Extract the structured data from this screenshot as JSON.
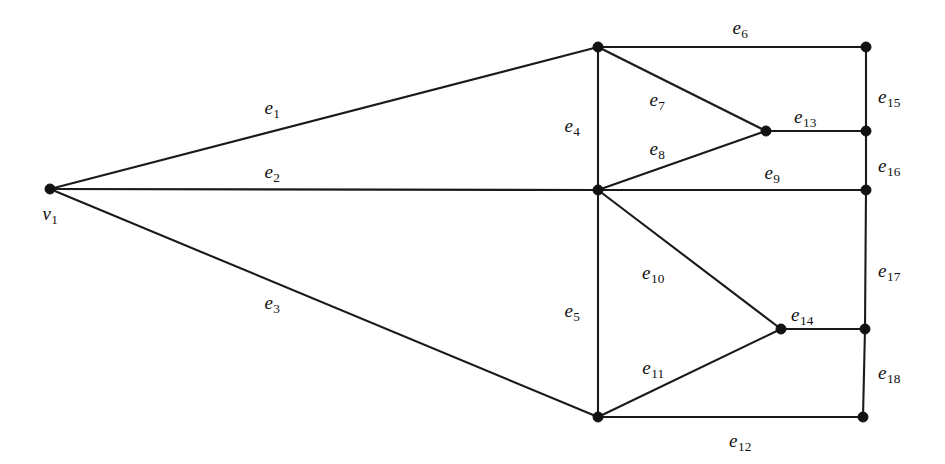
{
  "figure": {
    "width": 945,
    "height": 464,
    "background_color": "#ffffff",
    "ink_color": "#111111"
  },
  "chart_data": {
    "type": "diagram",
    "subtype": "node-link-graph",
    "title": "",
    "background": "#ffffff",
    "stroke_color": "#1a1a1a",
    "vertex_color": "#121212",
    "vertex_radius": 5,
    "nodes": [
      {
        "id": "v1",
        "label": "v",
        "sub": "1",
        "x": 50,
        "y": 189,
        "labeled": true,
        "label_x": 50,
        "label_y": 213
      },
      {
        "id": "a",
        "label": "",
        "sub": "",
        "x": 598,
        "y": 47,
        "labeled": false,
        "label_x": 0,
        "label_y": 0
      },
      {
        "id": "b",
        "label": "",
        "sub": "",
        "x": 598,
        "y": 190,
        "labeled": false,
        "label_x": 0,
        "label_y": 0
      },
      {
        "id": "c",
        "label": "",
        "sub": "",
        "x": 598,
        "y": 417,
        "labeled": false,
        "label_x": 0,
        "label_y": 0
      },
      {
        "id": "d",
        "label": "",
        "sub": "",
        "x": 766,
        "y": 131,
        "labeled": false,
        "label_x": 0,
        "label_y": 0
      },
      {
        "id": "e",
        "label": "",
        "sub": "",
        "x": 781,
        "y": 329,
        "labeled": false,
        "label_x": 0,
        "label_y": 0
      },
      {
        "id": "f",
        "label": "",
        "sub": "",
        "x": 866,
        "y": 47,
        "labeled": false,
        "label_x": 0,
        "label_y": 0
      },
      {
        "id": "g",
        "label": "",
        "sub": "",
        "x": 866,
        "y": 131,
        "labeled": false,
        "label_x": 0,
        "label_y": 0
      },
      {
        "id": "h",
        "label": "",
        "sub": "",
        "x": 866,
        "y": 190,
        "labeled": false,
        "label_x": 0,
        "label_y": 0
      },
      {
        "id": "i",
        "label": "",
        "sub": "",
        "x": 865,
        "y": 329,
        "labeled": false,
        "label_x": 0,
        "label_y": 0
      },
      {
        "id": "j",
        "label": "",
        "sub": "",
        "x": 863,
        "y": 417,
        "labeled": false,
        "label_x": 0,
        "label_y": 0
      }
    ],
    "edges": [
      {
        "id": "e1",
        "label": "e",
        "sub": "1",
        "from": "v1",
        "to": "a",
        "x1": 50,
        "y1": 189,
        "x2": 598,
        "y2": 47,
        "label_x": 272,
        "label_y": 107
      },
      {
        "id": "e2",
        "label": "e",
        "sub": "2",
        "from": "v1",
        "to": "b",
        "x1": 50,
        "y1": 189,
        "x2": 598,
        "y2": 190,
        "label_x": 272,
        "label_y": 171
      },
      {
        "id": "e3",
        "label": "e",
        "sub": "3",
        "from": "v1",
        "to": "c",
        "x1": 50,
        "y1": 189,
        "x2": 598,
        "y2": 417,
        "label_x": 272,
        "label_y": 302
      },
      {
        "id": "e4",
        "label": "e",
        "sub": "4",
        "from": "a",
        "to": "b",
        "x1": 598,
        "y1": 47,
        "x2": 598,
        "y2": 190,
        "label_x": 572,
        "label_y": 125
      },
      {
        "id": "e5",
        "label": "e",
        "sub": "5",
        "from": "b",
        "to": "c",
        "x1": 598,
        "y1": 190,
        "x2": 598,
        "y2": 417,
        "label_x": 572,
        "label_y": 310
      },
      {
        "id": "e6",
        "label": "e",
        "sub": "6",
        "from": "a",
        "to": "f",
        "x1": 598,
        "y1": 47,
        "x2": 866,
        "y2": 47,
        "label_x": 740,
        "label_y": 27
      },
      {
        "id": "e7",
        "label": "e",
        "sub": "7",
        "from": "a",
        "to": "d",
        "x1": 598,
        "y1": 47,
        "x2": 766,
        "y2": 131,
        "label_x": 657,
        "label_y": 99
      },
      {
        "id": "e8",
        "label": "e",
        "sub": "8",
        "from": "b",
        "to": "d",
        "x1": 598,
        "y1": 190,
        "x2": 766,
        "y2": 131,
        "label_x": 657,
        "label_y": 148
      },
      {
        "id": "e9",
        "label": "e",
        "sub": "9",
        "from": "b",
        "to": "h",
        "x1": 598,
        "y1": 190,
        "x2": 866,
        "y2": 190,
        "label_x": 772,
        "label_y": 172
      },
      {
        "id": "e10",
        "label": "e",
        "sub": "10",
        "from": "b",
        "to": "e",
        "x1": 598,
        "y1": 190,
        "x2": 781,
        "y2": 329,
        "label_x": 653,
        "label_y": 272
      },
      {
        "id": "e11",
        "label": "e",
        "sub": "11",
        "from": "c",
        "to": "e",
        "x1": 598,
        "y1": 417,
        "x2": 781,
        "y2": 329,
        "label_x": 653,
        "label_y": 367
      },
      {
        "id": "e12",
        "label": "e",
        "sub": "12",
        "from": "c",
        "to": "j",
        "x1": 598,
        "y1": 417,
        "x2": 863,
        "y2": 417,
        "label_x": 740,
        "label_y": 440
      },
      {
        "id": "e13",
        "label": "e",
        "sub": "13",
        "from": "d",
        "to": "g",
        "x1": 766,
        "y1": 131,
        "x2": 866,
        "y2": 131,
        "label_x": 805,
        "label_y": 116
      },
      {
        "id": "e14",
        "label": "e",
        "sub": "14",
        "from": "e",
        "to": "i",
        "x1": 781,
        "y1": 329,
        "x2": 865,
        "y2": 329,
        "label_x": 802,
        "label_y": 314
      },
      {
        "id": "e15",
        "label": "e",
        "sub": "15",
        "from": "f",
        "to": "g",
        "x1": 866,
        "y1": 47,
        "x2": 866,
        "y2": 131,
        "label_x": 889,
        "label_y": 96
      },
      {
        "id": "e16",
        "label": "e",
        "sub": "16",
        "from": "g",
        "to": "h",
        "x1": 866,
        "y1": 131,
        "x2": 866,
        "y2": 190,
        "label_x": 889,
        "label_y": 165
      },
      {
        "id": "e17",
        "label": "e",
        "sub": "17",
        "from": "h",
        "to": "i",
        "x1": 866,
        "y1": 190,
        "x2": 865,
        "y2": 329,
        "label_x": 889,
        "label_y": 270
      },
      {
        "id": "e18",
        "label": "e",
        "sub": "18",
        "from": "i",
        "to": "j",
        "x1": 865,
        "y1": 329,
        "x2": 863,
        "y2": 417,
        "label_x": 889,
        "label_y": 372
      }
    ]
  }
}
